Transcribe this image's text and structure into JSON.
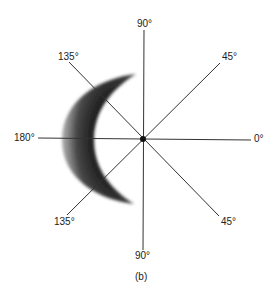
{
  "diagram": {
    "caption": "(b)",
    "labels": {
      "top": "90°",
      "bottom": "90°",
      "left": "180°",
      "right": "0°",
      "upper_left": "135°",
      "upper_right": "45°",
      "lower_left": "135°",
      "lower_right": "45°"
    },
    "colors": {
      "line": "#333333",
      "crescent": "#1a1a1a",
      "center_dot": "#111111"
    }
  }
}
